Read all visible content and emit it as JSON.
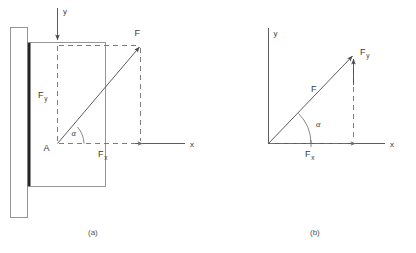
{
  "figure": {
    "captions": [
      {
        "id": "caption-a",
        "text": "(a)"
      },
      {
        "id": "caption-b",
        "text": "(b)"
      }
    ],
    "colors": {
      "line": "#4a4a4a",
      "thin_line": "#7a7a7a",
      "wall": "#1a1a1a",
      "dashed": "#6e6e6e",
      "text": "#3a3a3a",
      "caption": "#555555",
      "background": "#ffffff"
    }
  },
  "panel_a": {
    "caption": "(a)",
    "axes": {
      "y_label": "y",
      "x_label": "x"
    },
    "point_label": "A",
    "angle_label": "α",
    "force_label": "F",
    "force_y_label": "F",
    "force_y_sub": "y",
    "force_x_label": "F",
    "force_x_sub": "x",
    "elements": [
      {
        "name": "wall",
        "type": "vertical-support"
      },
      {
        "name": "plate",
        "type": "rectangular-plate"
      },
      {
        "name": "force-vector",
        "type": "arrow"
      },
      {
        "name": "component-vertical",
        "type": "dashed-arrow"
      },
      {
        "name": "component-horizontal",
        "type": "dashed-arrow"
      }
    ]
  },
  "panel_b": {
    "caption": "(b)",
    "axes": {
      "y_label": "y",
      "x_label": "x"
    },
    "angle_label": "α",
    "force_label": "F",
    "force_y_label": "F",
    "force_y_sub": "y",
    "force_x_label": "F",
    "force_x_sub": "x",
    "elements": [
      {
        "name": "force-vector",
        "type": "arrow"
      },
      {
        "name": "component-vertical",
        "type": "arrow"
      },
      {
        "name": "component-horizontal",
        "type": "dashed-arrow"
      }
    ]
  }
}
